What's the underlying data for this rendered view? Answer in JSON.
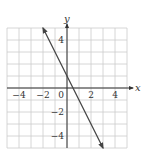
{
  "chart_data": {
    "type": "line",
    "title": "",
    "xlabel": "x",
    "ylabel": "y",
    "xlim": [
      -5,
      5
    ],
    "ylim": [
      -5,
      5
    ],
    "grid": true,
    "grid_step": 1,
    "x_ticks": [
      {
        "value": -4,
        "label": "−4"
      },
      {
        "value": -2,
        "label": "−2"
      },
      {
        "value": 0,
        "label": "0"
      },
      {
        "value": 2,
        "label": "2"
      },
      {
        "value": 4,
        "label": "4"
      }
    ],
    "y_ticks": [
      {
        "value": 4,
        "label": "4"
      },
      {
        "value": -2,
        "label": "−2"
      },
      {
        "value": -4,
        "label": "−4"
      }
    ],
    "series": [
      {
        "name": "y = -2x + 1",
        "equation": "y = -2x + 1",
        "slope": -2,
        "intercept": 1,
        "x": [
          -2,
          3
        ],
        "y": [
          5,
          -5
        ],
        "arrows_both_ends": true,
        "color": "#444444"
      }
    ],
    "colors": {
      "grid": "#cccccc",
      "axis": "#333333",
      "line": "#444444"
    }
  }
}
